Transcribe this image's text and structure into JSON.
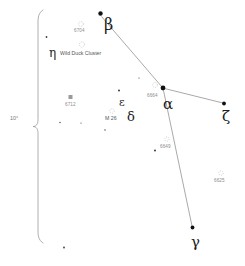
{
  "chart_data": {
    "type": "scatter",
    "xlabel": "",
    "ylabel": "",
    "xlim": [
      0,
      245
    ],
    "ylim": [
      0,
      266
    ],
    "grid": false,
    "legend": "none",
    "scale_bar": {
      "label": "10°",
      "label_x": 10,
      "label_y": 116,
      "brace_x": 38,
      "brace_top": 10,
      "brace_bottom": 243
    },
    "stars": [
      {
        "name": "beta",
        "label": "β",
        "x": 100.5,
        "y": 13.5,
        "r": 2.2,
        "mag": 4.2,
        "label_x": 104,
        "label_y": 17,
        "label_size": 16
      },
      {
        "name": "alpha",
        "label": "α",
        "x": 163.0,
        "y": 88.0,
        "r": 2.4,
        "mag": 3.8,
        "label_x": 163,
        "label_y": 97,
        "label_size": 15
      },
      {
        "name": "zeta",
        "label": "ζ",
        "x": 224.0,
        "y": 103.5,
        "r": 1.9,
        "mag": 4.6,
        "label_x": 222,
        "label_y": 109,
        "label_size": 15
      },
      {
        "name": "gamma",
        "label": "γ",
        "x": 192.5,
        "y": 227.5,
        "r": 1.9,
        "mag": 4.7,
        "label_x": 191,
        "label_y": 235,
        "label_size": 15
      },
      {
        "name": "delta",
        "label": "δ",
        "x": 128.0,
        "y": 112.0,
        "r": 0.0,
        "mag": 4.7,
        "label_x": 127,
        "label_y": 110,
        "label_size": 13
      },
      {
        "name": "epsilon",
        "label": "ε",
        "x": 120.0,
        "y": 100.0,
        "r": 0.0,
        "mag": 4.9,
        "label_x": 119,
        "label_y": 97,
        "label_size": 11
      },
      {
        "name": "eta",
        "label": "η",
        "x": 52.0,
        "y": 52.0,
        "r": 0.0,
        "mag": 4.8,
        "label_x": 49,
        "label_y": 47,
        "label_size": 12
      }
    ],
    "field_stars": [
      {
        "x": 46.5,
        "y": 37.0,
        "r": 0.9
      },
      {
        "x": 119.0,
        "y": 90.5,
        "r": 1.0
      },
      {
        "x": 60.0,
        "y": 122.5,
        "r": 0.7
      },
      {
        "x": 105.0,
        "y": 130.0,
        "r": 0.7
      },
      {
        "x": 155.0,
        "y": 150.5,
        "r": 1.0
      },
      {
        "x": 64.0,
        "y": 247.5,
        "r": 0.9
      },
      {
        "x": 81.0,
        "y": 123.0,
        "r": 0.6
      },
      {
        "x": 139.0,
        "y": 78.0,
        "r": 0.6
      }
    ],
    "deep_sky_objects": [
      {
        "name": "ngc-6704",
        "label": "6704",
        "marker": "open-cluster",
        "marker_x": 81.0,
        "marker_y": 24.0,
        "marker_r": 2.4,
        "label_x": 74.0,
        "label_y": 29.0
      },
      {
        "name": "m11-wild-duck-cluster",
        "label": "Wild Duck Cluster",
        "marker": "open-cluster",
        "marker_x": 82.0,
        "marker_y": 44.5,
        "marker_r": 2.6,
        "label_x": 60.0,
        "label_y": 51.0
      },
      {
        "name": "ngc-6712",
        "label": "6712",
        "marker": "globular-cluster",
        "marker_x": 70.5,
        "marker_y": 97.0,
        "marker_r": 2.0,
        "label_x": 65.0,
        "label_y": 103.0
      },
      {
        "name": "m26",
        "label": "M 26",
        "marker": "open-cluster",
        "marker_x": 112.0,
        "marker_y": 111.0,
        "marker_r": 2.3,
        "label_x": 105.0,
        "label_y": 116.0
      },
      {
        "name": "ngc-6664",
        "label": "6664",
        "marker": "open-cluster",
        "marker_x": 155.0,
        "marker_y": 85.0,
        "marker_r": 2.4,
        "label_x": 147.0,
        "label_y": 94.0
      },
      {
        "name": "ngc-6649",
        "label": "6649",
        "marker": "open-cluster",
        "marker_x": 167.0,
        "marker_y": 139.0,
        "marker_r": 2.2,
        "label_x": 160.0,
        "label_y": 145.0
      },
      {
        "name": "ngc-6625",
        "label": "6625",
        "marker": "open-cluster",
        "marker_x": 221.0,
        "marker_y": 173.0,
        "marker_r": 2.2,
        "label_x": 214.0,
        "label_y": 179.0
      }
    ],
    "constellation_lines": [
      {
        "name": "beta-alpha",
        "x1": 101.5,
        "y1": 16.5,
        "x2": 162.0,
        "y2": 87.0
      },
      {
        "name": "alpha-zeta",
        "x1": 164.5,
        "y1": 88.5,
        "x2": 223.0,
        "y2": 103.0
      },
      {
        "name": "alpha-gamma",
        "x1": 163.5,
        "y1": 90.5,
        "x2": 192.0,
        "y2": 226.0
      }
    ]
  }
}
